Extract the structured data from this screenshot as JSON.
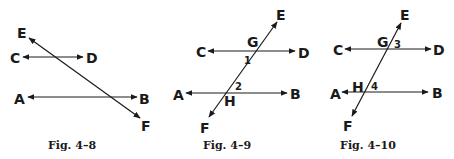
{
  "colors": {
    "ink": "#1a1a1a",
    "background": "#ffffff"
  },
  "figures": [
    {
      "caption": "Fig. 4–8",
      "labels": {
        "E": "E",
        "C": "C",
        "D": "D",
        "A": "A",
        "B": "B",
        "F": "F"
      }
    },
    {
      "caption": "Fig. 4–9",
      "labels": {
        "E": "E",
        "C": "C",
        "D": "D",
        "A": "A",
        "B": "B",
        "F": "F",
        "G": "G",
        "H": "H"
      },
      "angles": {
        "a1": "1",
        "a2": "2"
      }
    },
    {
      "caption": "Fig. 4–10",
      "labels": {
        "E": "E",
        "C": "C",
        "D": "D",
        "A": "A",
        "B": "B",
        "F": "F",
        "G": "G",
        "H": "H"
      },
      "angles": {
        "a3": "3",
        "a4": "4"
      }
    }
  ]
}
